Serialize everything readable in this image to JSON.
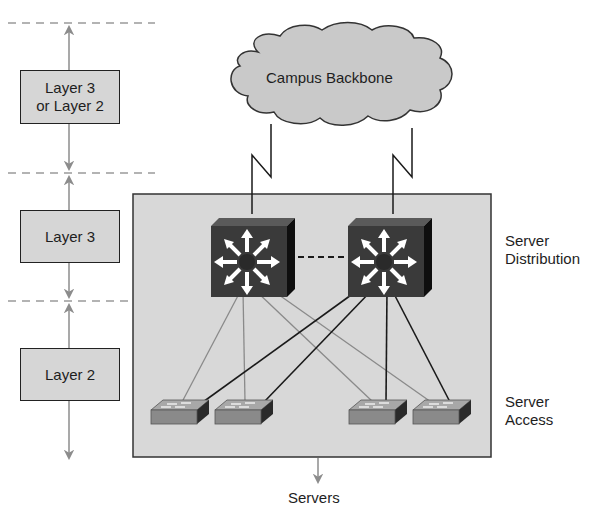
{
  "diagram": {
    "cloud": {
      "label": "Campus Backbone",
      "fill": "#c9c9c9"
    },
    "layers": [
      {
        "line1": "Layer 3",
        "line2": "or Layer 2"
      },
      {
        "line1": "Layer 3"
      },
      {
        "line1": "Layer 2"
      }
    ],
    "tiers": {
      "distribution": {
        "line1": "Server",
        "line2": "Distribution"
      },
      "access": {
        "line1": "Server",
        "line2": "Access"
      }
    },
    "servers_label": "Servers",
    "colors": {
      "panel": "#d8d8d8",
      "switch_face": "#3a3a3a",
      "switch_side": "#111111",
      "access_switch": "#8a8a8a",
      "arrow_gray": "#8c8c8c",
      "dash_gray": "#9a9a9a"
    },
    "nodes": {
      "distribution_switches": [
        "multilayer-switch-1",
        "multilayer-switch-2"
      ],
      "access_switches": [
        "access-switch-1",
        "access-switch-2",
        "access-switch-3",
        "access-switch-4"
      ]
    }
  }
}
